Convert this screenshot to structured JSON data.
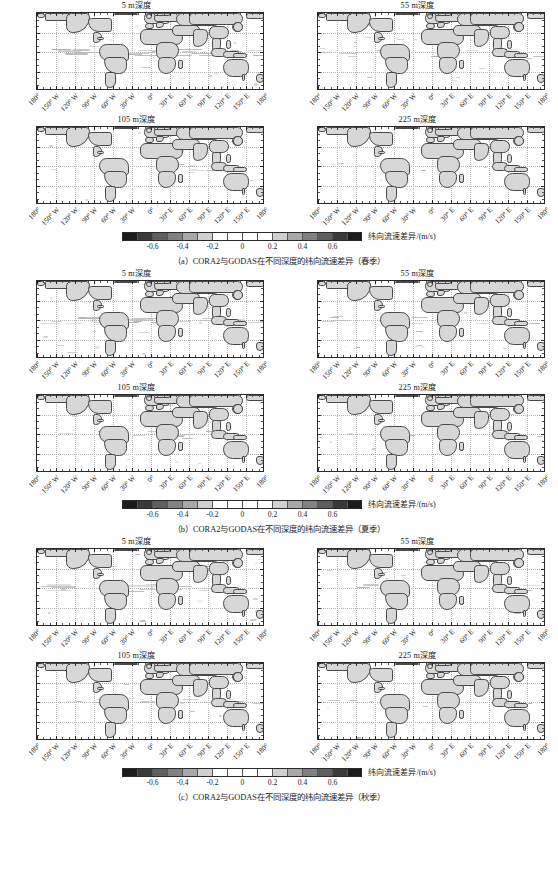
{
  "figure": {
    "axis": {
      "y_labels": [
        "60° N",
        "30° N",
        "0°",
        "30° S",
        "60° S"
      ],
      "y_values": [
        60,
        30,
        0,
        -30,
        -60
      ],
      "x_labels": [
        "180°",
        "150° W",
        "120° W",
        "90° W",
        "60° W",
        "30° W",
        "0°",
        "30° E",
        "60° E",
        "90° E",
        "120° E",
        "150° E",
        "180°"
      ],
      "x_values": [
        -180,
        -150,
        -120,
        -90,
        -60,
        -30,
        0,
        30,
        60,
        90,
        120,
        150,
        180
      ]
    },
    "colorbar": {
      "unit_label": "纬向流速差异/(m/s)",
      "tick_labels": [
        "-0.6",
        "-0.4",
        "-0.2",
        "0",
        "0.2",
        "0.4",
        "0.6"
      ],
      "tick_values": [
        -0.6,
        -0.4,
        -0.2,
        0,
        0.2,
        0.4,
        0.6
      ],
      "vmin": -0.8,
      "vmax": 0.8,
      "segment_colors": [
        "#1c1c1c",
        "#3a3a3a",
        "#5e5e5e",
        "#828282",
        "#a8a8a8",
        "#d0d0d0",
        "#ffffff",
        "#ffffff",
        "#ffffff",
        "#ffffff",
        "#d0d0d0",
        "#a8a8a8",
        "#828282",
        "#5e5e5e",
        "#3a3a3a",
        "#1c1c1c"
      ]
    },
    "panel_titles": {
      "depth_5": "5 m深度",
      "depth_55": "55 m深度",
      "depth_105": "105 m深度",
      "depth_225": "225 m深度"
    },
    "blocks": [
      {
        "id": "spring",
        "caption": "（a）CORA2与GODAS在不同深度的纬向流速差异（春季）",
        "panels": [
          "5 m深度",
          "55 m深度",
          "105 m深度",
          "225 m深度"
        ]
      },
      {
        "id": "summer",
        "caption": "（b）CORA2与GODAS在不同深度的纬向流速差异（夏季）",
        "panels": [
          "5 m深度",
          "55 m深度",
          "105 m深度",
          "225 m深度"
        ]
      },
      {
        "id": "autumn",
        "caption": "（c）CORA2与GODAS在不同深度的纬向流速差异（秋季）",
        "panels": [
          "5 m深度",
          "55 m深度",
          "105 m深度",
          "225 m深度"
        ]
      }
    ],
    "colors": {
      "land_fill": "#d7d7d7",
      "coastline": "#4a4a4a",
      "frame": "#2a2a2a",
      "background": "#ffffff"
    }
  },
  "chart_data": {
    "type": "heatmap",
    "title": "CORA2与GODAS在不同深度的纬向流速差异",
    "xlabel": "经度",
    "ylabel": "纬度",
    "xlim": [
      -180,
      180
    ],
    "ylim": [
      -60,
      60
    ],
    "grid": true,
    "legend_position": "bottom-center",
    "colorbar_label": "纬向流速差异/(m/s)",
    "colorbar_ticks": [
      -0.6,
      -0.4,
      -0.2,
      0,
      0.2,
      0.4,
      0.6
    ],
    "color_scale": "grayscale-diverging",
    "panels": [
      {
        "season": "春季",
        "depth_m": 5,
        "label": "5 m深度",
        "note": "赤道太平洋带状差异条纹"
      },
      {
        "season": "春季",
        "depth_m": 55,
        "label": "55 m深度",
        "note": "赤道带差异减弱"
      },
      {
        "season": "春季",
        "depth_m": 105,
        "label": "105 m深度",
        "note": "赤道太平洋西部差异"
      },
      {
        "season": "春季",
        "depth_m": 225,
        "label": "225 m深度",
        "note": "差异接近0"
      },
      {
        "season": "夏季",
        "depth_m": 5,
        "label": "5 m深度",
        "note": "赤道带状差异"
      },
      {
        "season": "夏季",
        "depth_m": 55,
        "label": "55 m深度",
        "note": "赤道带差异减弱"
      },
      {
        "season": "夏季",
        "depth_m": 105,
        "label": "105 m深度",
        "note": "赤道东太平洋差异"
      },
      {
        "season": "夏季",
        "depth_m": 225,
        "label": "225 m深度",
        "note": "差异接近0"
      },
      {
        "season": "秋季",
        "depth_m": 5,
        "label": "5 m深度",
        "note": "赤道带状差异"
      },
      {
        "season": "秋季",
        "depth_m": 55,
        "label": "55 m深度",
        "note": "赤道带差异减弱"
      },
      {
        "season": "秋季",
        "depth_m": 105,
        "label": "105 m深度",
        "note": "赤道太平洋差异"
      },
      {
        "season": "秋季",
        "depth_m": 225,
        "label": "225 m深度",
        "note": "差异接近0"
      }
    ]
  }
}
